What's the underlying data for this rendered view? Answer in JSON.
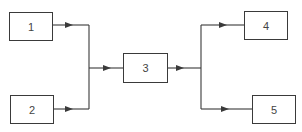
{
  "diagram": {
    "type": "block-flow",
    "nodes": [
      {
        "id": "1",
        "label": "1"
      },
      {
        "id": "2",
        "label": "2"
      },
      {
        "id": "3",
        "label": "3"
      },
      {
        "id": "4",
        "label": "4"
      },
      {
        "id": "5",
        "label": "5"
      }
    ],
    "edges": [
      {
        "from": "1",
        "to": "3"
      },
      {
        "from": "2",
        "to": "3"
      },
      {
        "from": "3",
        "to": "4"
      },
      {
        "from": "3",
        "to": "5"
      }
    ],
    "colors": {
      "stroke": "#3a3a3a",
      "background": "#ffffff",
      "text": "#444444"
    }
  }
}
